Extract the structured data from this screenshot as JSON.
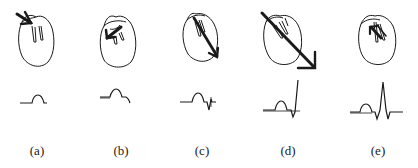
{
  "figure": {
    "ink_color": "#1a1a1a",
    "background": "#ffffff",
    "panels": [
      {
        "id": "a",
        "label": "(a)",
        "label_x": 37,
        "stage": "atrial depolarization",
        "waveform": "P wave only",
        "arrow": "short vector in upper-left atrium pointing down-right"
      },
      {
        "id": "b",
        "label": "(b)",
        "label_x": 121,
        "stage": "septal depolarization",
        "waveform": "P wave followed by small downward deflection (Q)",
        "arrow": "vector pointing up-left across septum"
      },
      {
        "id": "c",
        "label": "(c)",
        "label_x": 202,
        "stage": "early ventricular depolarization",
        "waveform": "P wave, Q dip, beginning upstroke",
        "arrow": "long vector pointing down-right along septum"
      },
      {
        "id": "d",
        "label": "(d)",
        "label_x": 288,
        "stage": "main ventricular depolarization",
        "waveform": "P wave, Q dip, tall R upstroke",
        "arrow": "large vector pointing down-right extending beyond heart outline"
      },
      {
        "id": "e",
        "label": "(e)",
        "label_x": 378,
        "stage": "late ventricular depolarization",
        "waveform": "complete P-QRS complex with S wave returning to baseline",
        "arrow": "small vector pointing up-left at base"
      }
    ]
  }
}
